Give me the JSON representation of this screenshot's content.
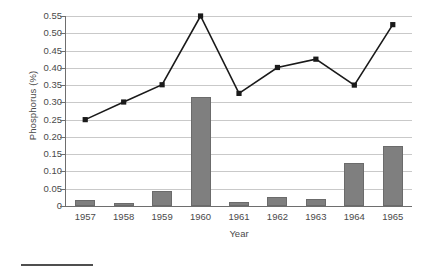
{
  "chart_data": {
    "type": "bar",
    "title": "",
    "xlabel": "Year",
    "ylabel": "Phosphorus (%)",
    "categories": [
      "1957",
      "1958",
      "1959",
      "1960",
      "1961",
      "1962",
      "1963",
      "1964",
      "1965"
    ],
    "ylim": [
      0,
      0.55
    ],
    "ytick_labels": [
      "0",
      "0.05",
      "0.10",
      "0.15",
      "0.20",
      "0.25",
      "0.30",
      "0.35",
      "0.40",
      "0.45",
      "0.50",
      "0.55"
    ],
    "ytick_values": [
      0,
      0.05,
      0.1,
      0.15,
      0.2,
      0.25,
      0.3,
      0.35,
      0.4,
      0.45,
      0.5,
      0.55
    ],
    "grid": true,
    "legend": "none",
    "series": [
      {
        "name": "Phosphorus (bars)",
        "type": "bar",
        "color": "#7f7f7f",
        "values": [
          0.018,
          0.009,
          0.044,
          0.317,
          0.012,
          0.026,
          0.021,
          0.125,
          0.175
        ]
      },
      {
        "name": "Phosphorus (line)",
        "type": "line",
        "color": "#1a1a1a",
        "marker": "square",
        "values": [
          0.25,
          0.301,
          0.351,
          0.55,
          0.326,
          0.401,
          0.425,
          0.35,
          0.525
        ]
      }
    ]
  },
  "axes": {
    "y_title": "Phosphorus (%)",
    "x_title": "Year"
  }
}
